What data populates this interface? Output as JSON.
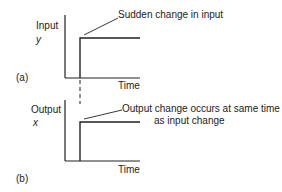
{
  "panel_a": {
    "tag": "(a)",
    "y_label": "Input",
    "y_symbol": "y",
    "x_label": "Time",
    "annotation": "Sudden change in input"
  },
  "panel_b": {
    "tag": "(b)",
    "y_label": "Output",
    "y_symbol": "x",
    "x_label": "Time",
    "annotation_line1": "Output change occurs at same time",
    "annotation_line2": "as input change"
  },
  "colors": {
    "line": "#222222",
    "background": "#ffffff"
  }
}
